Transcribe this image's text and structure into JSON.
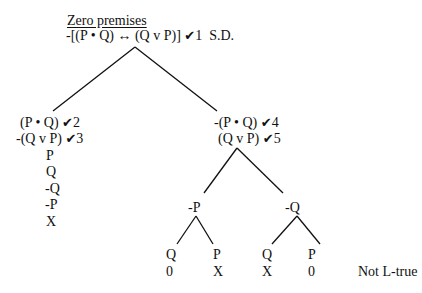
{
  "title": "Zero premises",
  "root": {
    "formula": "-[(P • Q) ↔ (Q v P)]",
    "check": "✔",
    "num": "1",
    "note": "S.D."
  },
  "left_branch": {
    "lines": [
      {
        "formula": "(P • Q)",
        "check": "✔",
        "num": "2"
      },
      {
        "formula": "-(Q v P)",
        "check": "✔",
        "num": "3"
      }
    ],
    "atoms": [
      "P",
      "Q",
      "-Q",
      "-P",
      "X"
    ]
  },
  "right_branch": {
    "lines": [
      {
        "formula": "-(P • Q)",
        "check": "✔",
        "num": "4"
      },
      {
        "formula": "(Q v P)",
        "check": "✔",
        "num": "5"
      }
    ],
    "sub_left": {
      "label": "-P",
      "leaves": [
        {
          "atom": "Q",
          "mark": "0"
        },
        {
          "atom": "P",
          "mark": "X"
        }
      ]
    },
    "sub_right": {
      "label": "-Q",
      "leaves": [
        {
          "atom": "Q",
          "mark": "X"
        },
        {
          "atom": "P",
          "mark": "0"
        }
      ]
    }
  },
  "verdict": "Not L-true"
}
